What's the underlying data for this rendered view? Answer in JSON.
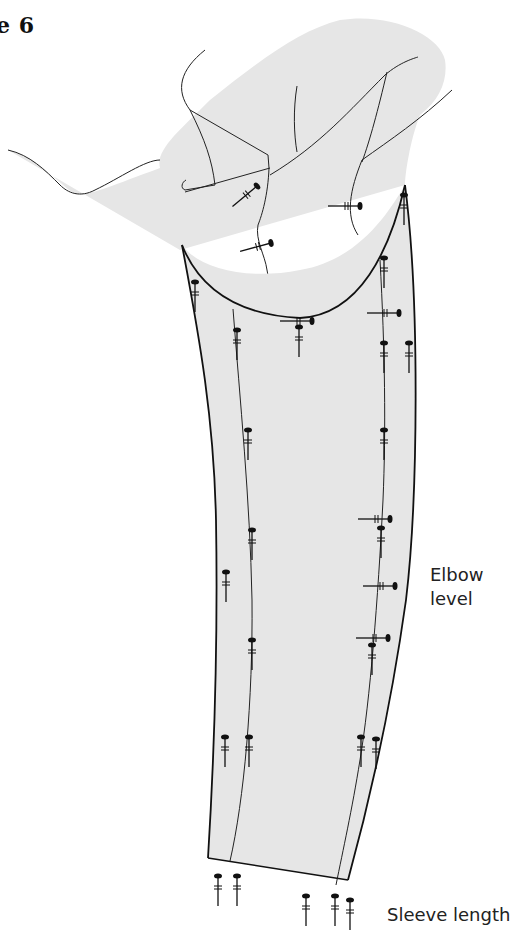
{
  "figure": {
    "title_fragment": "e 6",
    "fill_color": "#e6e6e6",
    "line_color": "#111111"
  },
  "labels": {
    "elbow": "Elbow\nlevel",
    "elbow_line1": "Elbow",
    "elbow_line2": "level",
    "sleeve_length": "Sleeve length"
  },
  "pins": {
    "count_approx": 40,
    "icon": "pin-icon"
  }
}
